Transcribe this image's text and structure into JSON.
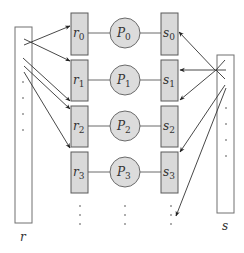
{
  "diagram": {
    "left_buffer": {
      "label": "r"
    },
    "right_buffer": {
      "label": "s"
    },
    "rows": [
      {
        "recv": "r",
        "recv_index": "0",
        "proc": "P",
        "proc_index": "0",
        "send": "s",
        "send_index": "0"
      },
      {
        "recv": "r",
        "recv_index": "1",
        "proc": "P",
        "proc_index": "1",
        "send": "s",
        "send_index": "1"
      },
      {
        "recv": "r",
        "recv_index": "2",
        "proc": "P",
        "proc_index": "2",
        "send": "s",
        "send_index": "2"
      },
      {
        "recv": "r",
        "recv_index": "3",
        "proc": "P",
        "proc_index": "3",
        "send": "s",
        "send_index": "3"
      }
    ],
    "continuation": "⋮",
    "colors": {
      "box_fill": "#d9d9d9",
      "circle_fill": "#dcdcdc",
      "stroke": "#5a5a5a",
      "arrow": "#333333"
    }
  }
}
